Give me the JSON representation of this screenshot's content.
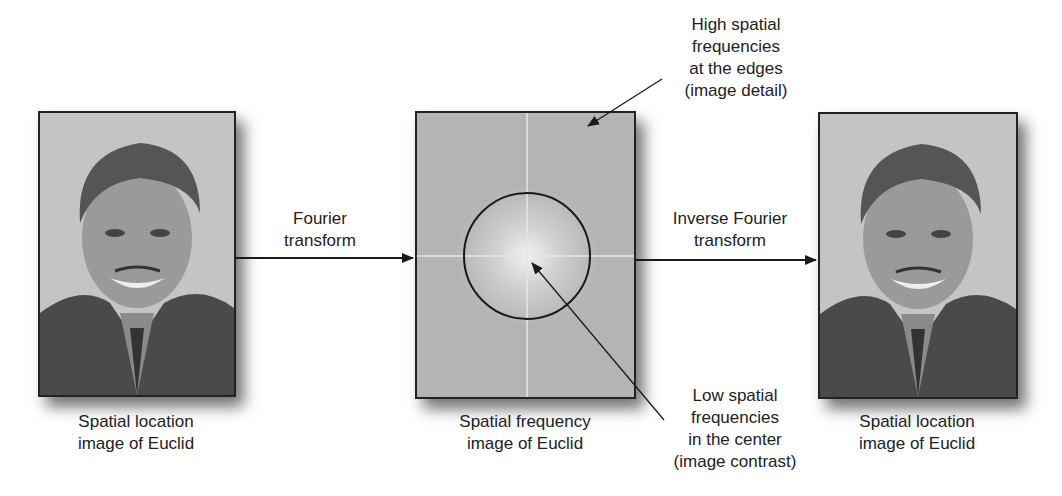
{
  "panels": {
    "left": {
      "caption_line1": "Spatial location",
      "caption_line2": "image of Euclid"
    },
    "middle": {
      "caption_line1": "Spatial frequency",
      "caption_line2": "image of Euclid"
    },
    "right": {
      "caption_line1": "Spatial location",
      "caption_line2": "image of Euclid"
    }
  },
  "arrows": {
    "forward": {
      "line1": "Fourier",
      "line2": "transform"
    },
    "inverse": {
      "line1": "Inverse Fourier",
      "line2": "transform"
    }
  },
  "annotations": {
    "high": {
      "line1": "High spatial",
      "line2": "frequencies",
      "line3": "at the edges",
      "line4": "(image detail)"
    },
    "low": {
      "line1": "Low spatial",
      "line2": "frequencies",
      "line3": "in the center",
      "line4": "(image contrast)"
    }
  },
  "colors": {
    "frequency_background": "#b4b4b4",
    "line": "#1a1a1a"
  }
}
